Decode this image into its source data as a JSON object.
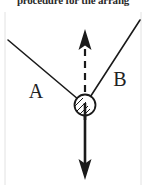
{
  "figure": {
    "clipped_caption": "procedure for the arrang",
    "width": 146,
    "height": 185,
    "background_color": "#ffffff",
    "ink_color": "#1a1a1a"
  },
  "diagram": {
    "type": "free-body-force-diagram",
    "hub": {
      "name": "hatched-pivot-circle",
      "center_x": 85,
      "center_y": 105,
      "radius": 11,
      "hatching": "diagonal-lines-lower-left"
    },
    "vectors": [
      {
        "id": "A",
        "label": "A",
        "label_x": 36,
        "label_y": 98,
        "style": "solid-line-no-arrowhead",
        "from_x": 85,
        "from_y": 105,
        "to_x": 8,
        "to_y": 40
      },
      {
        "id": "B",
        "label": "B",
        "label_x": 120,
        "label_y": 86,
        "style": "solid-line-no-arrowhead",
        "from_x": 85,
        "from_y": 105,
        "to_x": 140,
        "to_y": 20
      },
      {
        "id": "up",
        "label": "",
        "style": "dashed-line-with-arrowhead-up",
        "from_x": 85,
        "from_y": 105,
        "to_x": 85,
        "to_y": 30
      },
      {
        "id": "down",
        "label": "",
        "style": "solid-line-with-arrowhead-down",
        "from_x": 85,
        "from_y": 105,
        "to_x": 85,
        "to_y": 180
      }
    ],
    "page_rules": {
      "left_rule_x": 5,
      "right_rule_x": 141,
      "rule_color": "#dedede"
    }
  }
}
